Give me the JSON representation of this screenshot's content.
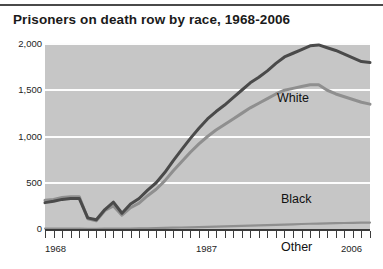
{
  "figure": {
    "title": "Prisoners on death row by race, 1968-2006",
    "background": "#ffffff",
    "plot_background": "#c6c6c6",
    "gridline_color": "#fdfdfd"
  },
  "axes": {
    "y_ticks": [
      "0",
      "500",
      "1,000",
      "1,500",
      "2,000"
    ],
    "x_ticks": [
      "1968",
      "1987",
      "2006"
    ]
  },
  "series_labels": {
    "white": "White",
    "black": "Black",
    "other": "Other"
  },
  "chart_data": {
    "type": "line",
    "title": "Prisoners on death row by race, 1968-2006",
    "xlabel": "",
    "ylabel": "",
    "xlim": [
      1968,
      2006
    ],
    "ylim": [
      0,
      2000
    ],
    "grid": true,
    "legend": "inline-annotations",
    "ytick_values": [
      0,
      500,
      1000,
      1500,
      2000
    ],
    "ytick_labels": [
      "0",
      "500",
      "1,000",
      "1,500",
      "2,000"
    ],
    "xtick_labels": [
      "1968",
      "1987",
      "2006"
    ],
    "x": [
      1968,
      1969,
      1970,
      1971,
      1972,
      1973,
      1974,
      1975,
      1976,
      1977,
      1978,
      1979,
      1980,
      1981,
      1982,
      1983,
      1984,
      1985,
      1986,
      1987,
      1988,
      1989,
      1990,
      1991,
      1992,
      1993,
      1994,
      1995,
      1996,
      1997,
      1998,
      1999,
      2000,
      2001,
      2002,
      2003,
      2004,
      2005,
      2006
    ],
    "series": [
      {
        "name": "White",
        "color": "#4a4a4a",
        "values": [
          285,
          300,
          320,
          330,
          330,
          120,
          100,
          210,
          290,
          170,
          270,
          330,
          420,
          500,
          610,
          740,
          860,
          980,
          1090,
          1190,
          1270,
          1340,
          1420,
          1500,
          1580,
          1640,
          1710,
          1790,
          1860,
          1900,
          1940,
          1980,
          1990,
          1960,
          1930,
          1890,
          1850,
          1810,
          1800
        ]
      },
      {
        "name": "Black",
        "color": "#8f8f8f",
        "values": [
          310,
          320,
          340,
          350,
          350,
          110,
          90,
          200,
          250,
          150,
          230,
          280,
          360,
          430,
          520,
          630,
          730,
          830,
          920,
          1000,
          1070,
          1130,
          1190,
          1250,
          1310,
          1360,
          1410,
          1460,
          1500,
          1520,
          1540,
          1560,
          1560,
          1500,
          1460,
          1430,
          1400,
          1370,
          1350
        ]
      },
      {
        "name": "Other",
        "color": "#8f8f8f",
        "values": [
          5,
          5,
          5,
          5,
          5,
          2,
          2,
          3,
          4,
          3,
          5,
          6,
          8,
          10,
          12,
          14,
          16,
          18,
          20,
          22,
          25,
          28,
          30,
          33,
          36,
          39,
          42,
          45,
          48,
          51,
          54,
          57,
          59,
          61,
          63,
          65,
          67,
          69,
          70
        ]
      }
    ]
  }
}
